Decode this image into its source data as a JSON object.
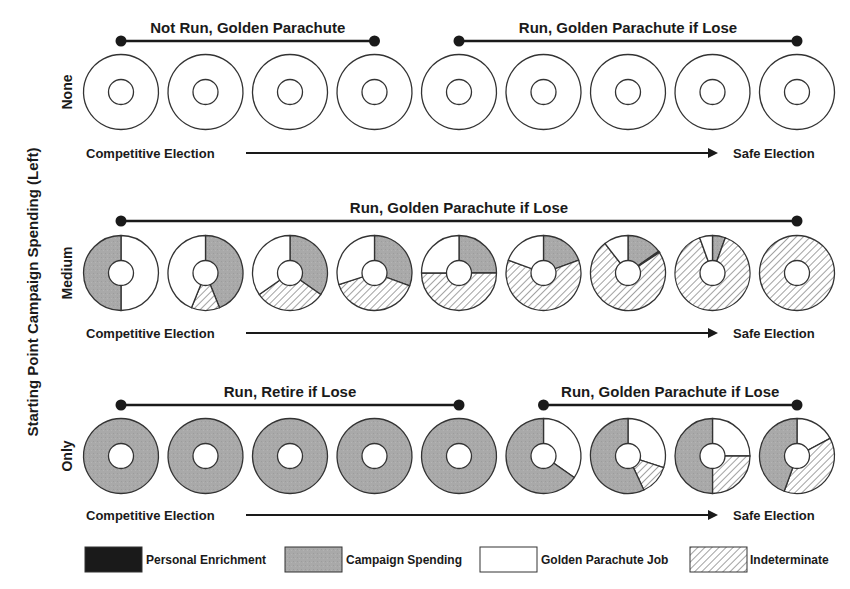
{
  "figure": {
    "y_axis_title": "Starting Point Campaign Spending (Left)",
    "x_axis_left": "Competitive Election",
    "x_axis_right": "Safe Election"
  },
  "colors": {
    "personal_enrichment": "#1a1a1a",
    "campaign_spending": "#a9a9a9",
    "golden_parachute_job": "#ffffff",
    "indeterminate_hatch": "#555555",
    "stroke": "#333333"
  },
  "legend": [
    {
      "key": "personal_enrichment",
      "label": "Personal Enrichment"
    },
    {
      "key": "campaign_spending",
      "label": "Campaign Spending"
    },
    {
      "key": "golden_parachute_job",
      "label": "Golden Parachute Job"
    },
    {
      "key": "indeterminate",
      "label": "Indeterminate"
    }
  ],
  "rows": [
    {
      "label": "None",
      "brackets": [
        {
          "text": "Not Run, Golden Parachute",
          "from": 0,
          "to": 3
        },
        {
          "text": "Run, Golden Parachute if Lose",
          "from": 4,
          "to": 8
        }
      ]
    },
    {
      "label": "Medium",
      "brackets": [
        {
          "text": "Run, Golden Parachute if Lose",
          "from": 0,
          "to": 8
        }
      ]
    },
    {
      "label": "Only",
      "brackets": [
        {
          "text": "Run, Retire if Lose",
          "from": 0,
          "to": 4
        },
        {
          "text": "Run, Golden Parachute if Lose",
          "from": 5,
          "to": 8
        }
      ]
    }
  ],
  "chart_data": {
    "type": "donut-grid",
    "title": "",
    "ylabel": "Starting Point Campaign Spending (Left)",
    "xlabel": "Competitive Election → Safe Election",
    "row_labels": [
      "None",
      "Medium",
      "Only"
    ],
    "columns": 9,
    "segment_order_note": "angles in degrees, clockwise from 12 o'clock",
    "donuts": [
      [
        [
          {
            "type": "outline",
            "start": 0,
            "end": 360
          }
        ],
        [
          {
            "type": "outline",
            "start": 0,
            "end": 360
          }
        ],
        [
          {
            "type": "outline",
            "start": 0,
            "end": 360
          }
        ],
        [
          {
            "type": "outline",
            "start": 0,
            "end": 360
          }
        ],
        [
          {
            "type": "outline",
            "start": 0,
            "end": 360
          }
        ],
        [
          {
            "type": "outline",
            "start": 0,
            "end": 360
          }
        ],
        [
          {
            "type": "outline",
            "start": 0,
            "end": 360
          }
        ],
        [
          {
            "type": "outline",
            "start": 0,
            "end": 360
          }
        ],
        [
          {
            "type": "outline",
            "start": 0,
            "end": 360
          }
        ]
      ],
      [
        [
          {
            "type": "golden",
            "start": 0,
            "end": 180
          },
          {
            "type": "campaign",
            "start": 180,
            "end": 360
          }
        ],
        [
          {
            "type": "campaign",
            "start": 0,
            "end": 158
          },
          {
            "type": "indeterminate",
            "start": 158,
            "end": 202
          },
          {
            "type": "golden",
            "start": 202,
            "end": 360
          }
        ],
        [
          {
            "type": "campaign",
            "start": 0,
            "end": 125
          },
          {
            "type": "indeterminate",
            "start": 125,
            "end": 235
          },
          {
            "type": "golden",
            "start": 235,
            "end": 360
          }
        ],
        [
          {
            "type": "campaign",
            "start": 0,
            "end": 110
          },
          {
            "type": "indeterminate",
            "start": 110,
            "end": 252
          },
          {
            "type": "golden",
            "start": 252,
            "end": 360
          }
        ],
        [
          {
            "type": "campaign",
            "start": 0,
            "end": 90
          },
          {
            "type": "indeterminate",
            "start": 90,
            "end": 270
          },
          {
            "type": "golden",
            "start": 270,
            "end": 360
          }
        ],
        [
          {
            "type": "campaign",
            "start": 0,
            "end": 70
          },
          {
            "type": "indeterminate",
            "start": 70,
            "end": 290
          },
          {
            "type": "golden",
            "start": 290,
            "end": 360
          }
        ],
        [
          {
            "type": "campaign",
            "start": 0,
            "end": 55
          },
          {
            "type": "personal",
            "start": 55,
            "end": 57
          },
          {
            "type": "indeterminate",
            "start": 57,
            "end": 322
          },
          {
            "type": "golden",
            "start": 322,
            "end": 360
          }
        ],
        [
          {
            "type": "campaign",
            "start": 0,
            "end": 20
          },
          {
            "type": "indeterminate",
            "start": 20,
            "end": 340
          },
          {
            "type": "golden",
            "start": 340,
            "end": 360
          }
        ],
        [
          {
            "type": "indeterminate",
            "start": 0,
            "end": 360
          }
        ]
      ],
      [
        [
          {
            "type": "campaign",
            "start": 0,
            "end": 360
          }
        ],
        [
          {
            "type": "campaign",
            "start": 0,
            "end": 360
          }
        ],
        [
          {
            "type": "campaign",
            "start": 0,
            "end": 360
          }
        ],
        [
          {
            "type": "campaign",
            "start": 0,
            "end": 360
          }
        ],
        [
          {
            "type": "campaign",
            "start": 0,
            "end": 360
          }
        ],
        [
          {
            "type": "golden",
            "start": 0,
            "end": 125
          },
          {
            "type": "campaign",
            "start": 125,
            "end": 360
          }
        ],
        [
          {
            "type": "golden",
            "start": 0,
            "end": 108
          },
          {
            "type": "indeterminate",
            "start": 108,
            "end": 155
          },
          {
            "type": "campaign",
            "start": 155,
            "end": 360
          }
        ],
        [
          {
            "type": "golden",
            "start": 0,
            "end": 90
          },
          {
            "type": "indeterminate",
            "start": 90,
            "end": 180
          },
          {
            "type": "campaign",
            "start": 180,
            "end": 360
          }
        ],
        [
          {
            "type": "golden",
            "start": 0,
            "end": 62
          },
          {
            "type": "indeterminate",
            "start": 62,
            "end": 200
          },
          {
            "type": "campaign",
            "start": 200,
            "end": 360
          }
        ]
      ]
    ]
  }
}
